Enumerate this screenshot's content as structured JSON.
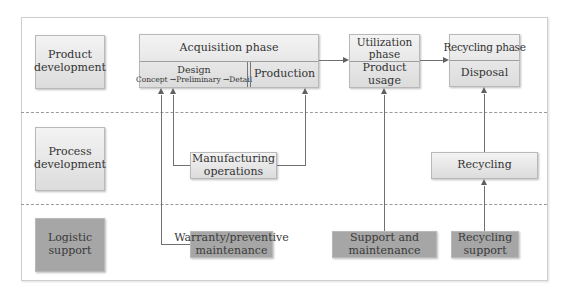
{
  "rows": [
    {
      "label": "Product development",
      "label_lines": [
        "Product",
        "development"
      ]
    },
    {
      "label": "Process development",
      "label_lines": [
        "Process",
        "development"
      ]
    },
    {
      "label": "Logistic support",
      "label_lines": [
        "Logistic",
        "support"
      ]
    }
  ],
  "phases": {
    "acquisition": {
      "title": "Acquisition phase",
      "design": {
        "title": "Design",
        "steps": [
          "Concept",
          "Preliminary",
          "Detail"
        ],
        "arrow_glyph": "→"
      },
      "production": "Production"
    },
    "utilization": {
      "title_lines": [
        "Utilization",
        "phase"
      ],
      "sub": "Product usage"
    },
    "recycling": {
      "title": "Recycling phase",
      "sub": "Disposal"
    }
  },
  "process_boxes": {
    "manufacturing_lines": [
      "Manufacturing",
      "operations"
    ],
    "recycling": "Recycling"
  },
  "logistic_boxes": {
    "warranty_lines": [
      "Warranty/preventive",
      "maintenance"
    ],
    "support_lines": [
      "Support and",
      "maintenance"
    ],
    "recycling_support_lines": [
      "Recycling",
      "support"
    ]
  },
  "colors": {
    "light_box": "#e6e6e6",
    "dark_box": "#a6a6a6",
    "line": "#707070",
    "dashed_separator": "#9a9a9a"
  }
}
